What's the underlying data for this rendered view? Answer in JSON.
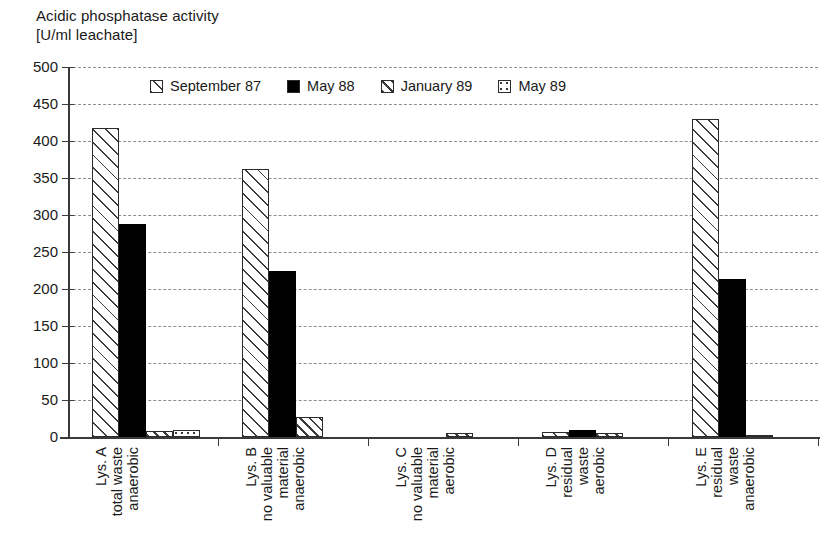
{
  "chart_data": {
    "type": "bar",
    "title": "Acidic phosphatase activity\n[U/ml leachate]",
    "title_line1": "Acidic phosphatase activity",
    "title_line2": "[U/ml leachate]",
    "xlabel": "",
    "ylabel": "",
    "ylim": [
      0,
      500
    ],
    "ytick_step": 50,
    "yticks": [
      "500",
      "450",
      "400",
      "350",
      "300",
      "250",
      "200",
      "150",
      "100",
      "50",
      "0"
    ],
    "grid": true,
    "grid_style": "dashed-horizontal",
    "legend_position": "top-inside",
    "categories": [
      "Lys. A total waste anaerobic",
      "Lys. B no valuable material anaerobic",
      "Lys. C no valuable material aerobic",
      "Lys. D residual waste aerobic",
      "Lys. E residual waste anaerobic"
    ],
    "category_lines": [
      [
        "Lys. A",
        "total waste",
        "anaerobic"
      ],
      [
        "Lys. B",
        "no valuable",
        "material",
        "anaerobic"
      ],
      [
        "Lys. C",
        "no valuable",
        "material",
        "aerobic"
      ],
      [
        "Lys. D",
        "residual",
        "waste",
        "aerobic"
      ],
      [
        "Lys. E",
        "residual",
        "waste",
        "anaerobic"
      ]
    ],
    "series": [
      {
        "name": "September 87",
        "pattern": "diagonal-hatch-wide",
        "values": [
          418,
          362,
          0,
          7,
          430
        ]
      },
      {
        "name": "May 88",
        "pattern": "solid-black",
        "values": [
          288,
          225,
          0,
          10,
          213
        ]
      },
      {
        "name": "January 89",
        "pattern": "diagonal-hatch-dense",
        "values": [
          8,
          27,
          6,
          5,
          3
        ]
      },
      {
        "name": "May 89",
        "pattern": "dotted",
        "values": [
          10,
          0,
          0,
          0,
          0
        ]
      }
    ]
  },
  "legend": {
    "items": [
      {
        "label": "September 87"
      },
      {
        "label": "May 88"
      },
      {
        "label": "January 89"
      },
      {
        "label": "May 89"
      }
    ]
  },
  "caption": {
    "text": ""
  }
}
